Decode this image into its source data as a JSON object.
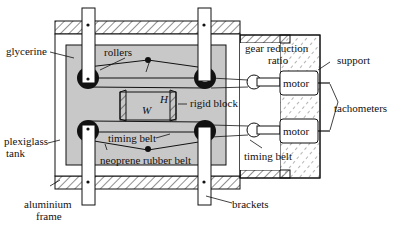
{
  "diagram": {
    "labels": {
      "glycerine": "glycerine",
      "rollers": "rollers",
      "gear_reduction_1": "gear reduction",
      "gear_reduction_2": "ratio",
      "support": "support",
      "rigid_block": "rigid block",
      "H": "H",
      "W": "W",
      "tachometers": "tachometers",
      "motor_top": "motor",
      "motor_bottom": "motor",
      "plexiglass_1": "plexiglass",
      "plexiglass_2": "tank",
      "timing_belt_inner": "timing belt",
      "timing_belt_outer": "timing belt",
      "neoprene": "neoprene rubber belt",
      "aluminium_1": "aluminium",
      "aluminium_2": "frame",
      "brackets": "brackets"
    },
    "colors": {
      "line": "#111111",
      "fluid": "#c8c8c8",
      "background": "#ffffff"
    }
  }
}
